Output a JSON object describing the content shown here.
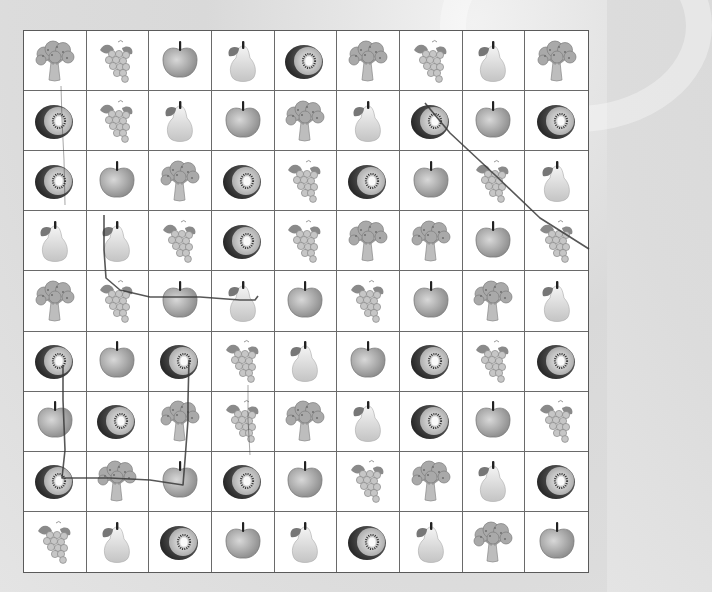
{
  "game": {
    "type": "fruit-link-puzzle",
    "rows": 9,
    "cols": 9,
    "legend": {
      "broccoli": "broccoli-icon",
      "grapes": "grapes-icon",
      "apple": "apple-icon",
      "pear": "pear-icon",
      "kiwi": "kiwi-icon"
    },
    "grid": [
      [
        "broccoli",
        "grapes",
        "apple",
        "pear",
        "kiwi",
        "broccoli",
        "grapes",
        "pear",
        "broccoli"
      ],
      [
        "kiwi",
        "grapes",
        "pear",
        "apple",
        "broccoli",
        "pear",
        "kiwi",
        "apple",
        "kiwi"
      ],
      [
        "kiwi",
        "apple",
        "broccoli",
        "kiwi",
        "grapes",
        "kiwi",
        "apple",
        "grapes",
        "pear"
      ],
      [
        "pear",
        "pear",
        "grapes",
        "kiwi",
        "grapes",
        "broccoli",
        "broccoli",
        "apple",
        "grapes"
      ],
      [
        "broccoli",
        "grapes",
        "apple",
        "pear",
        "apple",
        "grapes",
        "apple",
        "broccoli",
        "pear"
      ],
      [
        "kiwi",
        "apple",
        "kiwi",
        "grapes",
        "pear",
        "apple",
        "kiwi",
        "grapes",
        "kiwi"
      ],
      [
        "apple",
        "kiwi",
        "broccoli",
        "grapes",
        "broccoli",
        "pear",
        "kiwi",
        "apple",
        "grapes"
      ],
      [
        "kiwi",
        "broccoli",
        "apple",
        "kiwi",
        "apple",
        "grapes",
        "broccoli",
        "pear",
        "kiwi"
      ],
      [
        "grapes",
        "pear",
        "kiwi",
        "apple",
        "pear",
        "kiwi",
        "pear",
        "broccoli",
        "apple"
      ]
    ],
    "drawn_paths": [
      {
        "name": "path-col0-kiwi-vertical",
        "points": [
          [
            61,
            86
          ],
          [
            62,
            120
          ],
          [
            64,
            160
          ],
          [
            65,
            205
          ]
        ],
        "faint": true
      },
      {
        "name": "path-pear-to-pear",
        "points": [
          [
            104,
            215
          ],
          [
            104,
            250
          ],
          [
            106,
            278
          ],
          [
            120,
            290
          ],
          [
            150,
            297
          ],
          [
            200,
            297
          ],
          [
            240,
            300
          ],
          [
            255,
            300
          ],
          [
            258,
            296
          ]
        ]
      },
      {
        "name": "path-kiwi-diagonal",
        "points": [
          [
            425,
            103
          ],
          [
            450,
            133
          ],
          [
            495,
            175
          ],
          [
            540,
            218
          ],
          [
            589,
            249
          ]
        ]
      },
      {
        "name": "path-kiwi-to-kiwi-loop",
        "points": [
          [
            63,
            365
          ],
          [
            63,
            400
          ],
          [
            65,
            450
          ],
          [
            62,
            478
          ],
          [
            80,
            478
          ],
          [
            110,
            478
          ],
          [
            150,
            480
          ],
          [
            183,
            485
          ],
          [
            185,
            460
          ],
          [
            188,
            420
          ],
          [
            188,
            400
          ],
          [
            189,
            360
          ]
        ]
      },
      {
        "name": "path-grapes-vertical",
        "points": [
          [
            248,
            385
          ],
          [
            248,
            420
          ],
          [
            250,
            455
          ]
        ],
        "faint": true
      }
    ],
    "colors": {
      "background": "#dadada",
      "board": "#ffffff",
      "grid_line": "#6a6a6a",
      "path_line": "#3a3a3a"
    }
  }
}
